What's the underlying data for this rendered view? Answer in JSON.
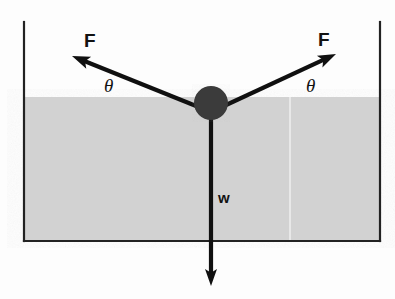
{
  "figure": {
    "type": "physics-force-diagram",
    "canvas": {
      "width": 395,
      "height": 299,
      "background": "#fdfdfd"
    },
    "container": {
      "name": "tank",
      "left_wall_x": 24,
      "right_wall_x": 380,
      "top_y": 22,
      "bottom_y": 241,
      "wall_color": "#222222",
      "wall_thickness": 2.2
    },
    "liquid": {
      "name": "shaded-liquid-region",
      "surface_y": 97,
      "bottom_y": 240,
      "left_x": 25,
      "right_x": 379,
      "fill_color": "#d2d2d2",
      "seam_x": 290,
      "seam_color": "#e8e8e8"
    },
    "ball": {
      "name": "ball",
      "center_x": 211,
      "center_y": 103,
      "radius": 17,
      "fill_color": "#3a3a3a"
    },
    "vertex": {
      "x": 211,
      "y": 112
    },
    "arrows": [
      {
        "id": "force-left",
        "label": "F",
        "label_x": 84,
        "label_y": 31,
        "from_x": 211,
        "from_y": 112,
        "to_x": 72,
        "to_y": 56,
        "color": "#101010",
        "width": 4.2,
        "head_length": 18,
        "head_width": 13
      },
      {
        "id": "force-right",
        "label": "F",
        "label_x": 318,
        "label_y": 30,
        "from_x": 211,
        "from_y": 112,
        "to_x": 336,
        "to_y": 54,
        "color": "#101010",
        "width": 4.2,
        "head_length": 18,
        "head_width": 13
      },
      {
        "id": "weight",
        "label": "w",
        "label_x": 218,
        "label_y": 190,
        "from_x": 211,
        "from_y": 112,
        "to_x": 211,
        "to_y": 286,
        "color": "#101010",
        "width": 4.2,
        "head_length": 17,
        "head_width": 12
      }
    ],
    "angles": [
      {
        "id": "angle-left",
        "label": "θ",
        "x": 104,
        "y": 76
      },
      {
        "id": "angle-right",
        "label": "θ",
        "x": 306,
        "y": 76
      }
    ],
    "colors": {
      "ink": "#101010",
      "liquid": "#d2d2d2",
      "ball": "#3a3a3a",
      "wall": "#222222",
      "page": "#fdfdfd"
    }
  }
}
